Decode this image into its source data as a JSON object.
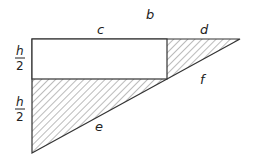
{
  "diagram": {
    "labels": {
      "b": "b",
      "c": "c",
      "d": "d",
      "e": "e",
      "f": "f",
      "half_top_num": "h",
      "half_top_den": "2",
      "half_bot_num": "h",
      "half_bot_den": "2"
    },
    "colors": {
      "stroke": "#333333",
      "hatch": "#555555",
      "background": "#ffffff"
    }
  }
}
